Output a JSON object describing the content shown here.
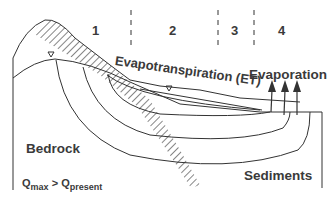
{
  "diagram": {
    "zones": [
      {
        "label": "1"
      },
      {
        "label": "2"
      },
      {
        "label": "3"
      },
      {
        "label": "4"
      }
    ],
    "labels": {
      "evapotranspiration": "Evapotranspiration (ET)",
      "evaporation": "Evaporation",
      "bedrock": "Bedrock",
      "sediments": "Sediments",
      "q_formula": {
        "q1": "Q",
        "sub1": "max",
        "op": " > ",
        "q2": "Q",
        "sub2": "present"
      }
    },
    "markers": {
      "water_table_symbol": "▽"
    },
    "colors": {
      "line": "#333333",
      "text": "#3a3a3a",
      "background": "#ffffff"
    }
  }
}
